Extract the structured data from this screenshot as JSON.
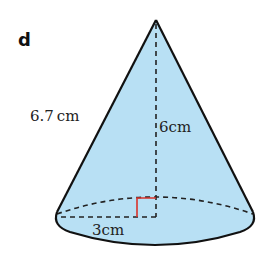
{
  "figure": {
    "part_label": "d",
    "shape": "cone",
    "labels": {
      "slant_height": "6.7 cm",
      "height": "6cm",
      "radius": "3cm"
    },
    "values": {
      "slant_height_cm": 6.7,
      "height_cm": 6,
      "radius_cm": 3
    },
    "colors": {
      "fill": "#b8e0f4",
      "outline": "#111111",
      "right_angle_marker": "#d9332b"
    }
  }
}
